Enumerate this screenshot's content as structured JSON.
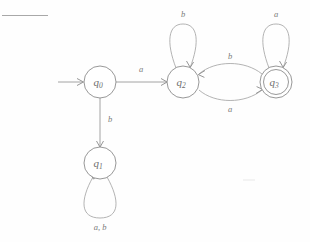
{
  "diagram": {
    "kind": "finite-automaton",
    "alphabet": [
      "a",
      "b"
    ],
    "states": [
      {
        "id": "q0",
        "label": "q",
        "subscript": "0",
        "accepting": false,
        "start": true,
        "cx": 100,
        "cy": 82,
        "r": 16
      },
      {
        "id": "q1",
        "label": "q",
        "subscript": "1",
        "accepting": false,
        "start": false,
        "cx": 100,
        "cy": 163,
        "r": 16
      },
      {
        "id": "q2",
        "label": "q",
        "subscript": "2",
        "accepting": false,
        "start": false,
        "cx": 183,
        "cy": 82,
        "r": 16
      },
      {
        "id": "q3",
        "label": "q",
        "subscript": "3",
        "accepting": true,
        "start": false,
        "cx": 276,
        "cy": 82,
        "r": 16
      }
    ],
    "transitions": [
      {
        "from": "start",
        "to": "q0",
        "label": "",
        "style": "start-arrow"
      },
      {
        "from": "q0",
        "to": "q2",
        "label": "a",
        "style": "straight-horizontal"
      },
      {
        "from": "q0",
        "to": "q1",
        "label": "b",
        "style": "straight-vertical"
      },
      {
        "from": "q1",
        "to": "q1",
        "label": "a, b",
        "style": "self-loop-below"
      },
      {
        "from": "q2",
        "to": "q2",
        "label": "b",
        "style": "self-loop-above"
      },
      {
        "from": "q2",
        "to": "q3",
        "label": "a",
        "style": "curve-lower"
      },
      {
        "from": "q3",
        "to": "q2",
        "label": "b",
        "style": "curve-upper"
      },
      {
        "from": "q3",
        "to": "q3",
        "label": "a",
        "style": "self-loop-above"
      }
    ],
    "labels": {
      "q0": "q0",
      "q1": "q1",
      "q2": "q2",
      "q3": "q3",
      "edge_q0_q2": "a",
      "edge_q0_q1": "b",
      "loop_q1": "a, b",
      "loop_q2": "b",
      "loop_q3": "a",
      "curve_q3_q2": "b",
      "curve_q2_q3": "a"
    },
    "colors": {
      "stroke": "#8c8c8c",
      "text": "#6e6e6e",
      "background": "#ffffff",
      "rule": "#a8a8a8"
    }
  }
}
